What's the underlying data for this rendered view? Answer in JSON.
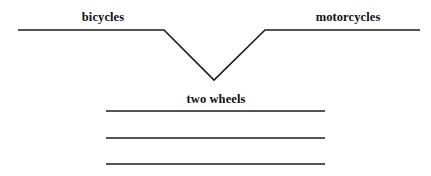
{
  "figure": {
    "type": "semantic-feature-diagram",
    "background_color": "#ffffff",
    "stroke_color": "#1a1a1a",
    "text_color": "#111111",
    "width": 431,
    "height": 176,
    "labels": {
      "left_branch": "bicycles",
      "right_branch": "motorcycles",
      "shared_feature": "two wheels"
    },
    "blank_feature_lines": {
      "count": 3,
      "labels": [
        "",
        "",
        ""
      ]
    }
  },
  "chart_data": {
    "type": "line",
    "title": "",
    "xlabel": "",
    "ylabel": "",
    "xlim": [
      0,
      431
    ],
    "ylim": [
      176,
      0
    ],
    "grid": false,
    "legend": "none",
    "series": [
      {
        "name": "notch-line",
        "x": [
          18,
          164,
          214,
          265,
          420
        ],
        "y": [
          30,
          30,
          80,
          30,
          30
        ]
      },
      {
        "name": "feature-line-1",
        "x": [
          106,
          325
        ],
        "y": [
          111,
          111
        ]
      },
      {
        "name": "feature-line-2",
        "x": [
          106,
          325
        ],
        "y": [
          138,
          138
        ]
      },
      {
        "name": "feature-line-3",
        "x": [
          106,
          325
        ],
        "y": [
          164,
          164
        ]
      }
    ],
    "annotations": [
      {
        "text": "bicycles",
        "x": 103,
        "y": 22
      },
      {
        "text": "motorcycles",
        "x": 348,
        "y": 22
      },
      {
        "text": "two wheels",
        "x": 216,
        "y": 104
      }
    ]
  }
}
